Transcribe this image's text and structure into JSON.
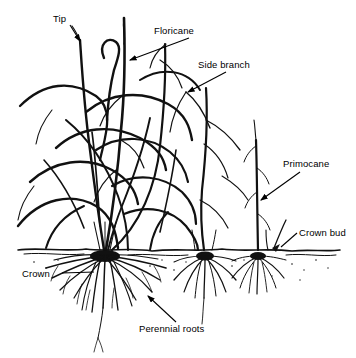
{
  "diagram": {
    "type": "botanical line drawing",
    "style": {
      "ink_color": "#000000",
      "background_color": "#ffffff",
      "label_font_size_px": 9.5
    },
    "labels": [
      {
        "id": "tip",
        "text": "Tip",
        "x": 53,
        "y": 14,
        "leader": {
          "type": "arrow",
          "from": [
            70,
            25
          ],
          "to": [
            80,
            41
          ]
        }
      },
      {
        "id": "floricane",
        "text": "Floricane",
        "x": 154,
        "y": 26,
        "leader": {
          "type": "arrow",
          "from": [
            155,
            38
          ],
          "to": [
            128,
            60
          ]
        }
      },
      {
        "id": "side_branch",
        "text": "Side branch",
        "x": 198,
        "y": 60,
        "leader": {
          "type": "arrow",
          "from": [
            203,
            72
          ],
          "to": [
            186,
            92
          ]
        }
      },
      {
        "id": "primocane",
        "text": "Primocane",
        "x": 283,
        "y": 159,
        "leader": {
          "type": "arrow",
          "from": [
            286,
            172
          ],
          "to": [
            259,
            200
          ]
        }
      },
      {
        "id": "crown_bud",
        "text": "Crown bud",
        "x": 299,
        "y": 228,
        "leader": {
          "type": "line",
          "from": [
            296,
            233
          ],
          "to": [
            279,
            246
          ]
        }
      },
      {
        "id": "crown",
        "text": "Crown",
        "x": 22,
        "y": 269,
        "leader": {
          "type": "line",
          "from": [
            60,
            273
          ],
          "to": [
            92,
            273
          ]
        }
      },
      {
        "id": "perennial_roots",
        "text": "Perennial roots",
        "x": 139,
        "y": 324,
        "leader": {
          "type": "arrow",
          "from": [
            176,
            322
          ],
          "to": [
            148,
            296
          ]
        }
      }
    ],
    "soil_line": {
      "y": 250,
      "x_start": 18,
      "x_end": 340
    },
    "crowns": [
      {
        "id": "crown-main",
        "x": 105,
        "y": 252,
        "root_spread": 62,
        "root_depth": 58
      },
      {
        "id": "crown-middle",
        "x": 205,
        "y": 252,
        "root_spread": 34,
        "root_depth": 36
      },
      {
        "id": "crown-right",
        "x": 258,
        "y": 252,
        "root_spread": 30,
        "root_depth": 32
      }
    ],
    "canes": {
      "floricane_count": 5,
      "primocane_count": 1,
      "description": "Multiple arching floricanes with side branches rising from the main crown, plus an upright primocane from the right crown."
    }
  }
}
